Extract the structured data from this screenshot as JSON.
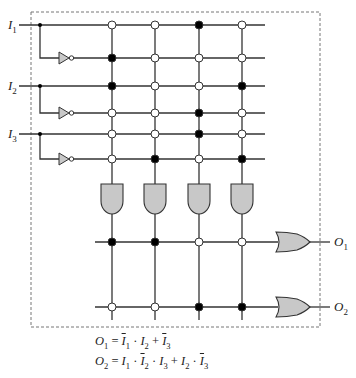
{
  "inputs": [
    {
      "name": "I",
      "sub": "1"
    },
    {
      "name": "I",
      "sub": "2"
    },
    {
      "name": "I",
      "sub": "3"
    }
  ],
  "outputs": [
    {
      "name": "O",
      "sub": "1"
    },
    {
      "name": "O",
      "sub": "2"
    }
  ],
  "and_plane": {
    "rows": [
      "I1",
      "~I1",
      "I2",
      "~I2",
      "I3",
      "~I3"
    ],
    "columns": 4,
    "connections": [
      [
        0,
        0,
        1,
        0
      ],
      [
        1,
        0,
        0,
        0
      ],
      [
        1,
        0,
        0,
        1
      ],
      [
        0,
        0,
        1,
        0
      ],
      [
        0,
        0,
        1,
        0
      ],
      [
        0,
        1,
        0,
        1
      ]
    ]
  },
  "or_plane": {
    "rows": [
      "O1",
      "O2"
    ],
    "connections": [
      [
        1,
        1,
        0,
        0
      ],
      [
        0,
        0,
        1,
        1
      ]
    ]
  },
  "equations": {
    "o1": {
      "lhs": "O",
      "lhs_sub": "1",
      "rhs_text": "= I̅1 · I2 + I̅3"
    },
    "o2": {
      "lhs": "O",
      "lhs_sub": "2",
      "rhs_text": "= I1 · I̅2 · I3 + I2 · I̅3"
    }
  },
  "colors": {
    "line": "#333333",
    "gate_fill": "#c8c8c8",
    "dot_filled": "#000000",
    "dot_open": "#ffffff",
    "dashed_border": "#777777"
  }
}
